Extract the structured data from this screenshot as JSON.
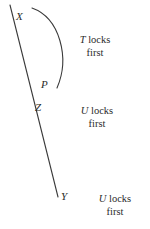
{
  "diagram": {
    "type": "timeline-lock-diagram",
    "background_color": "#ffffff",
    "stroke_color": "#3a3a3a",
    "text_color": "#2b2b2b",
    "points": {
      "x_label": "X",
      "p_label": "P",
      "z_label": "Z",
      "y_label": "Y"
    },
    "captions": {
      "first_symbol": "T",
      "first_line1": "locks",
      "first_line2": "first",
      "second_symbol": "U",
      "second_line1": "locks",
      "second_line2": "first",
      "third_symbol": "U",
      "third_line1": "locks",
      "third_line2": "first"
    },
    "geometry": {
      "main_line_start": "10,5",
      "main_line_end": "58,197",
      "arc_start": "32,8",
      "arc_end": "57,88",
      "arc_bulge_x": 68
    }
  }
}
